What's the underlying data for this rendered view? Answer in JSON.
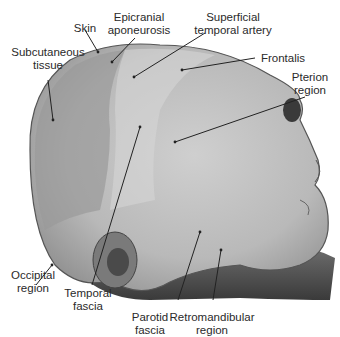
{
  "figure": {
    "type": "anatomical-photograph",
    "labels": [
      {
        "id": "skin",
        "lines": [
          "Skin"
        ]
      },
      {
        "id": "epicranial",
        "lines": [
          "Epicranial",
          "aponeurosis"
        ]
      },
      {
        "id": "sta",
        "lines": [
          "Superficial",
          "temporal artery"
        ]
      },
      {
        "id": "subcut",
        "lines": [
          "Subcutaneous",
          "tissue"
        ]
      },
      {
        "id": "frontalis",
        "lines": [
          "Frontalis"
        ]
      },
      {
        "id": "pterion",
        "lines": [
          "Pterion",
          "region"
        ]
      },
      {
        "id": "occipital",
        "lines": [
          "Occipital",
          "region"
        ]
      },
      {
        "id": "temporal",
        "lines": [
          "Temporal",
          "fascia"
        ]
      },
      {
        "id": "parotid",
        "lines": [
          "Parotid",
          "fascia"
        ]
      },
      {
        "id": "retro",
        "lines": [
          "Retromandibular",
          "region"
        ]
      }
    ]
  }
}
